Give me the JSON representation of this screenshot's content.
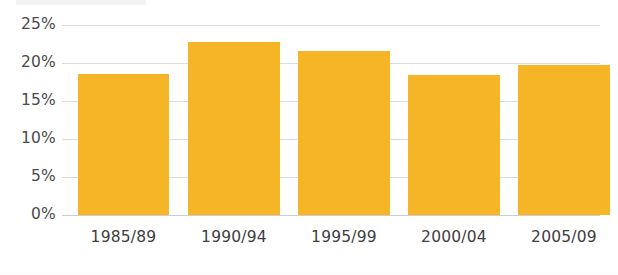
{
  "chart_data": {
    "type": "bar",
    "title": "",
    "subtitle": "",
    "xlabel": "",
    "ylabel": "",
    "categories": [
      "1985/89",
      "1990/94",
      "1995/99",
      "2000/04",
      "2005/09"
    ],
    "values": [
      18.6,
      22.7,
      21.6,
      18.4,
      19.8
    ],
    "value_labels": [
      "18.6%",
      "22.7%",
      "21.6%",
      "18.4%",
      "19.8%"
    ],
    "ylim": [
      0,
      25
    ],
    "ytick_values": [
      0,
      5,
      10,
      15,
      20,
      25
    ],
    "ytick_labels": [
      "0%",
      "5%",
      "10%",
      "15%",
      "20%",
      "25%"
    ],
    "grid": true,
    "grid_axis": "y",
    "legend": false,
    "legend_position": "none",
    "series": [
      {
        "name": "",
        "color": "#f5b526",
        "values": [
          18.6,
          22.7,
          21.6,
          18.4,
          19.8
        ]
      }
    ],
    "colors": {
      "bar": "#f5b526",
      "grid": "#d9dde1",
      "axis": "#c9ced3",
      "tick_text": "#4a4a4a",
      "category_text": "#404040",
      "background": "#ffffff"
    }
  }
}
